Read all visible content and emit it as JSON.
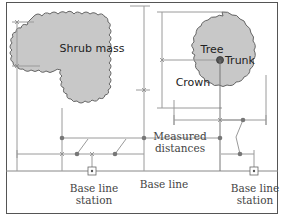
{
  "diagram": {
    "labels": {
      "shrub": "Shrub mass",
      "tree": "Tree",
      "trunk": "Trunk",
      "crown": "Crown",
      "measured_1": "Measured",
      "measured_2": "distances",
      "baseline": "Base line",
      "station_left_1": "Base line",
      "station_left_2": "station",
      "station_right_1": "Base line",
      "station_right_2": "station"
    },
    "colors": {
      "background": "#ffffff",
      "border": "#555555",
      "fill": "#c8c8c8",
      "outline": "#666666",
      "dimension_line": "#9a9a9a",
      "point": "#777777",
      "text": "#444444"
    }
  }
}
